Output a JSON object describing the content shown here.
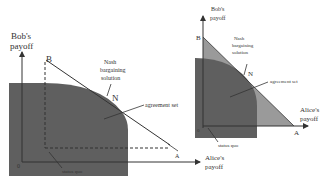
{
  "left_panel": {
    "y_axis_label_line1": "Bob's",
    "y_axis_label_line2": "payoff",
    "x_axis_label_line1": "Alice's",
    "x_axis_label_line2": "payoff",
    "point_B": "B",
    "point_A": "A",
    "point_N": "N",
    "origin": "0",
    "nash_line1": "Nash",
    "nash_line2": "bargaining",
    "nash_line3": "solution",
    "agreement_label": "agreement set",
    "status_quo_label": "status quo"
  },
  "right_panel": {
    "y_axis_label_line1": "Bob's",
    "y_axis_label_line2": "payoff",
    "x_axis_label_line1": "Alice's",
    "x_axis_label_line2": "payoff",
    "point_B": "B",
    "point_A": "A",
    "point_N": "N",
    "origin": "0",
    "nash_line1": "Nash",
    "nash_line2": "bargaining",
    "nash_line3": "solution",
    "agreement_label": "agreement set",
    "status_quo_label": "status quo"
  },
  "colors": {
    "agreement_fill": "#5f5f5f",
    "triangle_fill": "#9a9a9a",
    "line": "#333333"
  }
}
